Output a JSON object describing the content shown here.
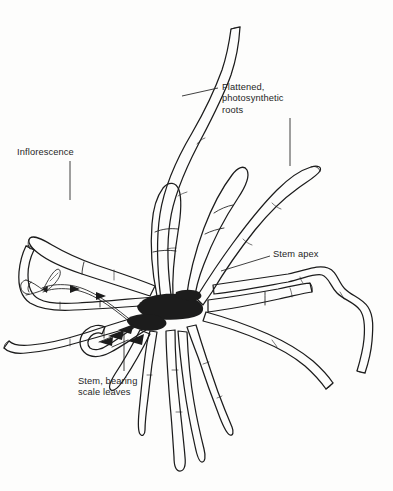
{
  "figure": {
    "background_color": "#fdfdfc",
    "ink_color": "#1c1c1c",
    "text_color": "#262626",
    "width": 393,
    "height": 491
  },
  "labels": [
    {
      "id": "flattened-photosynthetic-roots",
      "text": "Flattened,\nphotosynthetic\nroots",
      "lines": [
        "Flattened,",
        "photosynthetic",
        "roots"
      ],
      "x": 222,
      "y": 82
    },
    {
      "id": "inflorescence",
      "text": "Inflorescence",
      "lines": [
        "Inflorescence"
      ],
      "x": 17,
      "y": 147
    },
    {
      "id": "stem-apex",
      "text": "Stem apex",
      "lines": [
        "Stem apex"
      ],
      "x": 273,
      "y": 249
    },
    {
      "id": "stem-bearing-scale-leaves",
      "text": "Stem, bearing\nscale leaves",
      "lines": [
        "Stem, bearing",
        "scale leaves"
      ],
      "x": 78,
      "y": 376
    }
  ],
  "leader_lines": [
    {
      "id": "leader-flattened-roots",
      "from": [
        218,
        88
      ],
      "to": [
        182,
        96
      ]
    },
    {
      "id": "leader-photosynthetic-roots-vertical",
      "from": [
        290,
        116
      ],
      "to": [
        290,
        165
      ]
    },
    {
      "id": "leader-inflorescence",
      "from": [
        70,
        160
      ],
      "to": [
        70,
        199
      ]
    },
    {
      "id": "leader-stem-apex",
      "from": [
        270,
        255
      ],
      "to": [
        222,
        270
      ]
    },
    {
      "id": "leader-stem-scale-leaves",
      "from": [
        124,
        372
      ],
      "to": [
        124,
        331
      ]
    }
  ],
  "plant_parts": [
    "flattened photosynthetic roots",
    "stem apex",
    "stem bearing scale leaves",
    "inflorescence"
  ]
}
